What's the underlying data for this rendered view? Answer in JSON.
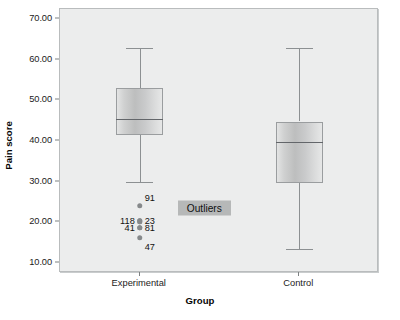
{
  "chart_data": {
    "type": "box",
    "title": "",
    "xlabel": "Group",
    "ylabel": "Pain score",
    "ylim": [
      7.5,
      72.5
    ],
    "yticks": [
      10,
      20,
      30,
      40,
      50,
      60,
      70
    ],
    "ytick_labels": [
      "10.00",
      "20.00",
      "30.00",
      "40.00",
      "50.00",
      "60.00",
      "70.00"
    ],
    "categories": [
      "Experimental",
      "Control"
    ],
    "grid": false,
    "legend": "none",
    "boxes": [
      {
        "category": "Experimental",
        "whisker_low": 30.0,
        "q1": 41.5,
        "median": 45.5,
        "q3": 53.0,
        "whisker_high": 62.8,
        "outliers": [
          {
            "case": "91",
            "value": 24.0
          },
          {
            "case": "23",
            "value": 20.3
          },
          {
            "case": "118",
            "value": 20.3
          },
          {
            "case": "81",
            "value": 18.6
          },
          {
            "case": "41",
            "value": 18.6
          },
          {
            "case": "47",
            "value": 16.2
          }
        ]
      },
      {
        "category": "Control",
        "whisker_low": 13.3,
        "q1": 29.7,
        "median": 39.8,
        "q3": 44.8,
        "whisker_high": 62.8,
        "outliers": []
      }
    ],
    "annotations": [
      {
        "text": "Outliers",
        "value": 23.5,
        "style": "highlight-box"
      }
    ],
    "colors": {
      "plot_background": "#eceded",
      "box_fill": "#c9cacb",
      "box_border": "#9a9d9f",
      "median": "#63666a",
      "whisker": "#8c9092",
      "outlier_marker": "#86898b",
      "annotation_background": "#b6b8b8",
      "text": "#111111"
    }
  }
}
